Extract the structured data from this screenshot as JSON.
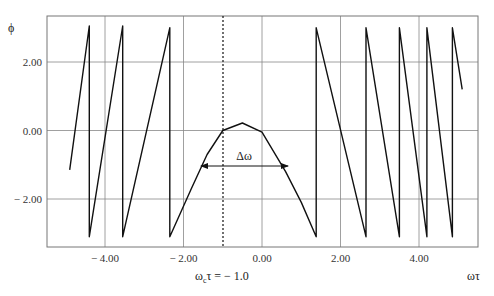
{
  "chart_data": {
    "type": "line",
    "title": "",
    "xlabel": "ωτ",
    "ylabel": "ϕ",
    "xlim": [
      -5.48,
      5.5
    ],
    "ylim": [
      -3.4,
      3.35
    ],
    "grid": true,
    "x_ticks": [
      -4.0,
      -2.0,
      0.0,
      2.0,
      4.0
    ],
    "x_tick_labels": [
      "− 4.00",
      "− 2.00",
      "0.00",
      "2.00",
      "4.00"
    ],
    "y_ticks": [
      2.0,
      0.0,
      -2.0
    ],
    "y_tick_labels": [
      "2.00",
      "0.00",
      "− 2.00"
    ],
    "annotations": [
      {
        "text": "ω_cτ = − 1.0",
        "type": "vertical-dotted-line",
        "x": -1.0
      },
      {
        "text": "Δω",
        "type": "double-arrow",
        "x_from": -1.6,
        "x_to": 0.66,
        "y": -1.05
      }
    ],
    "series": [
      {
        "name": "phase ϕ(ωτ) (wrapped to [−π, π])",
        "points": [
          [
            -4.9,
            -1.15
          ],
          [
            -4.4,
            3.05
          ],
          [
            -4.4,
            -3.1
          ],
          [
            -3.55,
            3.05
          ],
          [
            -3.55,
            -3.1
          ],
          [
            -2.35,
            3.0
          ],
          [
            -2.35,
            -3.1
          ],
          [
            -1.8,
            -1.7
          ],
          [
            -1.4,
            -0.7
          ],
          [
            -1.0,
            0.0
          ],
          [
            -0.5,
            0.22
          ],
          [
            0.0,
            -0.05
          ],
          [
            0.6,
            -1.2
          ],
          [
            1.0,
            -2.1
          ],
          [
            1.38,
            -3.1
          ],
          [
            1.38,
            3.0
          ],
          [
            2.65,
            -3.1
          ],
          [
            2.65,
            3.0
          ],
          [
            3.5,
            -3.1
          ],
          [
            3.5,
            3.0
          ],
          [
            4.2,
            -3.1
          ],
          [
            4.2,
            3.0
          ],
          [
            4.85,
            -3.1
          ],
          [
            4.85,
            3.0
          ],
          [
            5.1,
            1.2
          ]
        ]
      }
    ]
  },
  "axis": {
    "y_label": "ϕ",
    "x_label": "ωτ",
    "center_label": "ω",
    "center_label_sub": "c",
    "center_label_rest": "τ = − 1.0",
    "delta_label": "Δω"
  }
}
